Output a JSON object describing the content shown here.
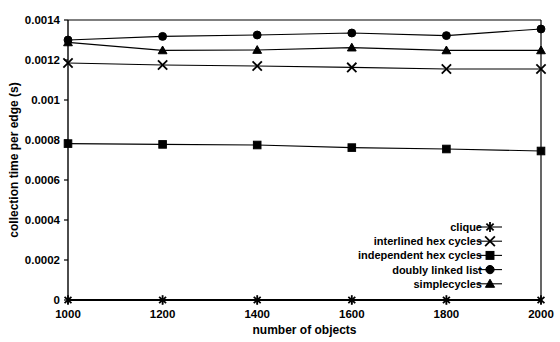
{
  "chart_data": {
    "type": "line",
    "title": "",
    "xlabel": "number of objects",
    "ylabel": "collection time per edge (s)",
    "x": [
      1000,
      1200,
      1400,
      1600,
      1800,
      2000
    ],
    "xtick_labels": [
      "1000",
      "1200",
      "1400",
      "1600",
      "1800",
      "2000"
    ],
    "ytick_labels": [
      "0",
      "0.0002",
      "0.0004",
      "0.0006",
      "0.0008",
      "0.001",
      "0.0012",
      "0.0014"
    ],
    "yticks": [
      0,
      0.0002,
      0.0004,
      0.0006,
      0.0008,
      0.001,
      0.0012,
      0.0014
    ],
    "xlim": [
      1000,
      2000
    ],
    "ylim": [
      0,
      0.0014
    ],
    "grid": false,
    "legend_position": "inside-bottom-right",
    "series": [
      {
        "name": "clique",
        "marker": "asterisk",
        "values": [
          0.0,
          0.0,
          0.0,
          0.0,
          0.0,
          0.0
        ]
      },
      {
        "name": "interlined hex cycles",
        "marker": "cross",
        "values": [
          0.001185,
          0.001175,
          0.00117,
          0.001163,
          0.001155,
          0.001155
        ]
      },
      {
        "name": "independent hex cycles",
        "marker": "square",
        "values": [
          0.000782,
          0.000778,
          0.000775,
          0.000762,
          0.000755,
          0.000745
        ]
      },
      {
        "name": "doubly linked list",
        "marker": "circle",
        "values": [
          0.0013,
          0.001318,
          0.001325,
          0.001335,
          0.001322,
          0.001355
        ]
      },
      {
        "name": "simplecycles",
        "marker": "triangle",
        "values": [
          0.001288,
          0.001248,
          0.00125,
          0.001262,
          0.001248,
          0.001248
        ]
      }
    ]
  },
  "legend": {
    "items": [
      {
        "label": "clique",
        "marker": "asterisk"
      },
      {
        "label": "interlined hex cycles",
        "marker": "cross"
      },
      {
        "label": "independent hex cycles",
        "marker": "square"
      },
      {
        "label": "doubly linked list",
        "marker": "circle"
      },
      {
        "label": "simplecycles",
        "marker": "triangle"
      }
    ]
  },
  "colors": {
    "foreground": "#000000",
    "background": "#ffffff"
  }
}
